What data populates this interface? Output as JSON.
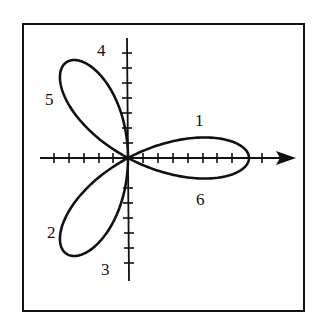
{
  "figure": {
    "type": "polar-rose",
    "petals": 3,
    "petal_angles_deg": [
      0,
      120,
      240
    ],
    "colors": {
      "ink": "#111111",
      "background": "#ffffff"
    }
  },
  "labels": [
    {
      "id": "1",
      "text": "1"
    },
    {
      "id": "2",
      "text": "2"
    },
    {
      "id": "3",
      "text": "3"
    },
    {
      "id": "4",
      "text": "4"
    },
    {
      "id": "5",
      "text": "5"
    },
    {
      "id": "6",
      "text": "6"
    }
  ],
  "axes": {
    "x_axis": {
      "arrow": true,
      "tick_count_left": 6,
      "tick_count_right": 9
    },
    "y_axis": {
      "arrow": false,
      "tick_count_up": 6,
      "tick_count_down": 6
    }
  }
}
